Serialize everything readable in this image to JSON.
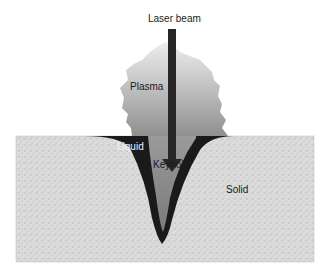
{
  "diagram": {
    "labels": {
      "laser_beam": "Laser beam",
      "plasma": "Plasma",
      "liquid": "Liquid",
      "keyhole": "Keyhole",
      "solid": "Solid"
    },
    "colors": {
      "solid_fill": "#d9d9d9",
      "liquid_fill": "#1a1a1a",
      "keyhole_fill": "#8c8c8c",
      "plasma_top": "#e6e6e6",
      "plasma_bottom": "#9a9a9a",
      "beam": "#262626"
    }
  }
}
